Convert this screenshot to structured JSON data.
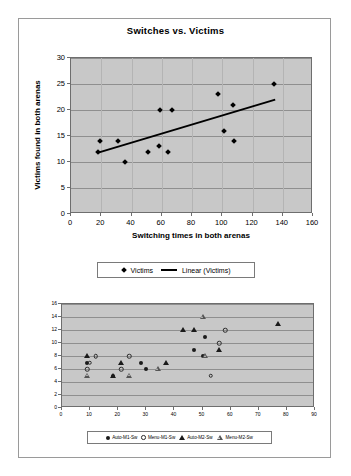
{
  "chart_data": [
    {
      "type": "scatter",
      "title": "Switches vs. Victims",
      "xlabel": "Switching times in both arenas",
      "ylabel": "Victims found in both arenas",
      "xlim": [
        0,
        160
      ],
      "ylim": [
        0,
        30
      ],
      "xticks": [
        0,
        20,
        40,
        60,
        80,
        100,
        120,
        140,
        160
      ],
      "yticks": [
        0,
        5,
        10,
        15,
        20,
        25,
        30
      ],
      "grid": "horizontal",
      "legend_position": "bottom",
      "legend": [
        "Victims",
        "Linear (Victims)"
      ],
      "series": [
        {
          "name": "Victims",
          "marker": "diamond",
          "points": [
            [
              18,
              12
            ],
            [
              19,
              14
            ],
            [
              31,
              14
            ],
            [
              36,
              10
            ],
            [
              51,
              12
            ],
            [
              58,
              13
            ],
            [
              59,
              20
            ],
            [
              64,
              12
            ],
            [
              67,
              20
            ],
            [
              97,
              23
            ],
            [
              101,
              16
            ],
            [
              107,
              21
            ],
            [
              108,
              14
            ],
            [
              134,
              25
            ]
          ]
        },
        {
          "name": "Linear (Victims)",
          "marker": "line",
          "trendline": [
            [
              18,
              11.8
            ],
            [
              135,
              22.0
            ]
          ]
        }
      ]
    },
    {
      "type": "scatter",
      "title": "",
      "xlabel": "",
      "ylabel": "",
      "xlim": [
        0,
        90
      ],
      "ylim": [
        0,
        16
      ],
      "xticks": [
        0,
        10,
        20,
        30,
        40,
        50,
        60,
        70,
        80,
        90
      ],
      "yticks": [
        0,
        2,
        4,
        6,
        8,
        10,
        12,
        14,
        16
      ],
      "grid": "horizontal",
      "legend_position": "bottom",
      "legend": [
        "Auto-M1-Sw",
        "Menu-M1-Sw",
        "Auto-M2-Sw",
        "Menu-M2-Sw"
      ],
      "series": [
        {
          "name": "Auto-M1-Sw",
          "marker": "filled-circle",
          "points": [
            [
              9,
              7
            ],
            [
              18,
              5
            ],
            [
              28,
              7
            ],
            [
              30,
              6
            ],
            [
              47,
              9
            ],
            [
              50,
              8
            ],
            [
              51,
              11
            ]
          ]
        },
        {
          "name": "Menu-M1-Sw",
          "marker": "open-circle",
          "points": [
            [
              9.8,
              7
            ],
            [
              9,
              6
            ],
            [
              12,
              8
            ],
            [
              21,
              6
            ],
            [
              24,
              8
            ],
            [
              53,
              5
            ],
            [
              56,
              10
            ],
            [
              58,
              12
            ]
          ]
        },
        {
          "name": "Auto-M2-Sw",
          "marker": "filled-triangle",
          "points": [
            [
              9,
              8
            ],
            [
              18,
              5
            ],
            [
              21,
              7
            ],
            [
              37,
              7
            ],
            [
              43,
              12
            ],
            [
              47,
              12
            ],
            [
              56,
              9
            ],
            [
              77,
              13
            ]
          ]
        },
        {
          "name": "Menu-M2-Sw",
          "marker": "open-triangle",
          "points": [
            [
              9,
              5
            ],
            [
              24,
              5
            ],
            [
              34,
              6
            ],
            [
              50,
              14
            ],
            [
              51,
              8
            ]
          ]
        }
      ]
    }
  ]
}
